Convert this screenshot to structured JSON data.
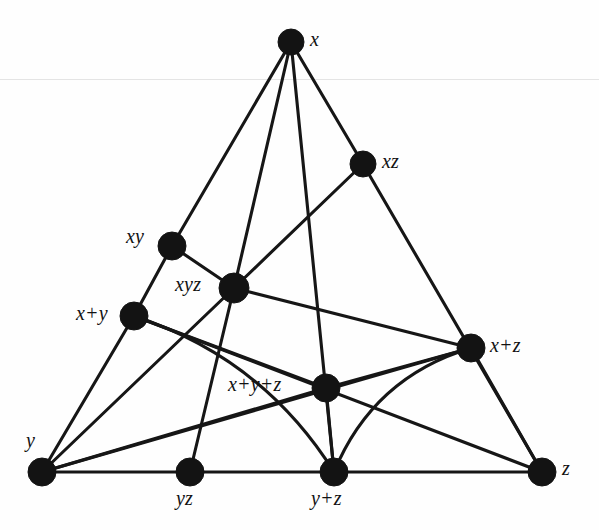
{
  "figure": {
    "width": 599,
    "height": 530,
    "background_color": "#fefefe",
    "ink_color": "#131313"
  },
  "nodes": [
    {
      "id": "x",
      "label": "x",
      "cx": 291,
      "cy": 42,
      "r": 13,
      "label_x": 310,
      "label_y": 29,
      "anchor": "right"
    },
    {
      "id": "xz",
      "label": "xz",
      "cx": 363,
      "cy": 164,
      "r": 13,
      "label_x": 382,
      "label_y": 151,
      "anchor": "right"
    },
    {
      "id": "xy",
      "label": "xy",
      "cx": 172,
      "cy": 246,
      "r": 14,
      "label_x": 126,
      "label_y": 226,
      "anchor": "left"
    },
    {
      "id": "xyz",
      "label": "xyz",
      "cx": 234,
      "cy": 288,
      "r": 15,
      "label_x": 175,
      "label_y": 274,
      "anchor": "left"
    },
    {
      "id": "x+y",
      "label": "x+y",
      "cx": 134,
      "cy": 316,
      "r": 14,
      "label_x": 76,
      "label_y": 303,
      "anchor": "left"
    },
    {
      "id": "x+z",
      "label": "x+z",
      "cx": 471,
      "cy": 348,
      "r": 14,
      "label_x": 490,
      "label_y": 335,
      "anchor": "right"
    },
    {
      "id": "x+y+z",
      "label": "x+y+z",
      "cx": 326,
      "cy": 388,
      "r": 14,
      "label_x": 228,
      "label_y": 374,
      "anchor": "left"
    },
    {
      "id": "y",
      "label": "y",
      "cx": 42,
      "cy": 472,
      "r": 14,
      "label_x": 26,
      "label_y": 430,
      "anchor": "above-left"
    },
    {
      "id": "yz",
      "label": "yz",
      "cx": 190,
      "cy": 472,
      "r": 14,
      "label_x": 176,
      "label_y": 488,
      "anchor": "below"
    },
    {
      "id": "y+z",
      "label": "y+z",
      "cx": 334,
      "cy": 472,
      "r": 14,
      "label_x": 311,
      "label_y": 488,
      "anchor": "below"
    },
    {
      "id": "z",
      "label": "z",
      "cx": 542,
      "cy": 472,
      "r": 14,
      "label_x": 562,
      "label_y": 458,
      "anchor": "right"
    }
  ],
  "edges": [
    {
      "from": "x",
      "to": "xy",
      "kind": "line"
    },
    {
      "from": "x",
      "to": "xyz",
      "kind": "line"
    },
    {
      "from": "x",
      "to": "xz",
      "kind": "line"
    },
    {
      "from": "x",
      "to": "y+z",
      "kind": "line"
    },
    {
      "from": "xz",
      "to": "xyz",
      "kind": "line"
    },
    {
      "from": "xz",
      "to": "z",
      "kind": "line"
    },
    {
      "from": "xy",
      "to": "xyz",
      "kind": "line"
    },
    {
      "from": "xy",
      "to": "x+y",
      "kind": "line"
    },
    {
      "from": "xyz",
      "to": "y",
      "kind": "line"
    },
    {
      "from": "xyz",
      "to": "yz",
      "kind": "line"
    },
    {
      "from": "xyz",
      "to": "x+z",
      "kind": "line"
    },
    {
      "from": "x+y",
      "to": "y",
      "kind": "line"
    },
    {
      "from": "x+y",
      "to": "x+y+z",
      "kind": "line"
    },
    {
      "from": "x+y",
      "to": "z",
      "kind": "line"
    },
    {
      "from": "x+y+z",
      "to": "x+z",
      "kind": "line"
    },
    {
      "from": "x+y+z",
      "to": "y",
      "kind": "line"
    },
    {
      "from": "x+y+z",
      "to": "y+z",
      "kind": "line"
    },
    {
      "from": "x+z",
      "to": "y",
      "kind": "line"
    },
    {
      "from": "x+z",
      "to": "z",
      "kind": "line"
    },
    {
      "from": "y",
      "to": "yz",
      "kind": "line"
    },
    {
      "from": "yz",
      "to": "y+z",
      "kind": "line"
    },
    {
      "from": "y+z",
      "to": "z",
      "kind": "line"
    },
    {
      "from": "x+y",
      "to": "y+z",
      "kind": "curve",
      "bow": -46
    },
    {
      "from": "x+z",
      "to": "y+z",
      "kind": "curve",
      "bow": 44
    }
  ],
  "lattice_data": {
    "type": "hasse-diagram",
    "element_count": 11,
    "edge_count": 24,
    "elements": [
      "x",
      "xz",
      "xy",
      "xyz",
      "x+y",
      "x+z",
      "x+y+z",
      "y",
      "yz",
      "y+z",
      "z"
    ],
    "top_element": "x",
    "bottom_elements": [
      "y",
      "yz",
      "y+z",
      "z"
    ]
  }
}
